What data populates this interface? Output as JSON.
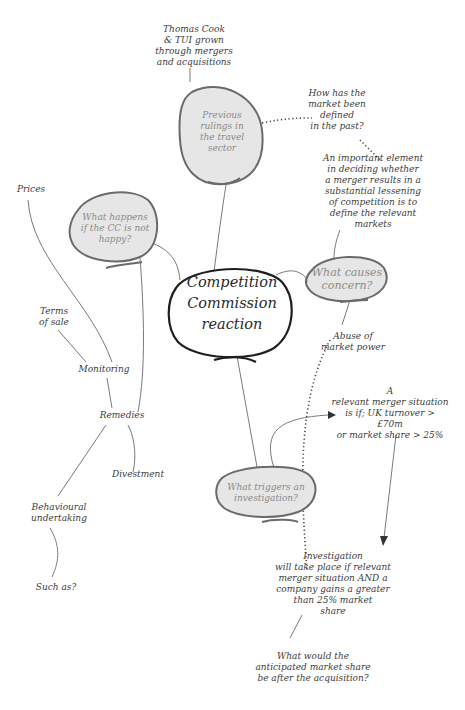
{
  "colors": {
    "bubble_fill": "#e6e6e6",
    "bubble_stroke": "#6a6a6a",
    "center_stroke": "#1e1e1e",
    "line": "#7a7a7a",
    "text": "#3c3c3c",
    "bubble_text": "#8a8a8a"
  },
  "center": {
    "label": "Competition\nCommission\nreaction"
  },
  "bubbles": {
    "previous_rulings": "Previous\nrulings in\nthe travel\nsector",
    "what_happens": "What happens\nif the CC is not\nhappy?",
    "what_causes": "What causes\nconcern?",
    "what_triggers": "What triggers an\ninvestigation?"
  },
  "notes": {
    "thomas_cook": "Thomas Cook\n& TUI grown\nthrough mergers\nand acquisitions",
    "market_defined": "How has the\nmarket been defined\nin the past?",
    "important_element": "An important element\nin deciding whether\na merger results in a\nsubstantial lessening\nof competition is to\ndefine the relevant\nmarkets",
    "abuse": "Abuse of\nmarket power",
    "relevant_merger": "A\nrelevant merger situation\nis if; UK turnover >\n£70m\nor market share > 25%",
    "investigation": "Investigation\nwill take place if relevant\nmerger situation AND a\ncompany gains a greater\nthan 25% market\nshare",
    "anticipated": "What would the\nanticipated market share\nbe after the acquisition?",
    "prices": "Prices",
    "terms": "Terms\nof sale",
    "monitoring": "Monitoring",
    "remedies": "Remedies",
    "divestment": "Divestment",
    "behavioural": "Behavioural\nundertaking",
    "such_as": "Such as?"
  }
}
